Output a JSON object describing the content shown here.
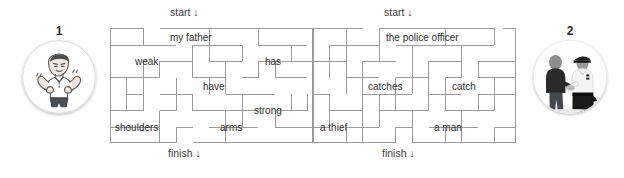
{
  "page": {
    "background_color": "#ffffff",
    "wall_color": "#9a9a9a",
    "text_color": "#2f2f2f"
  },
  "exercises": [
    {
      "number": "1",
      "avatar_icon": "strong-man-flexing-illustration",
      "avatar_alt": "cartoon man flexing biceps",
      "start_label": "start ↓",
      "finish_label": "finish ↓",
      "words": [
        {
          "text": "my father",
          "x": 63,
          "y": 10
        },
        {
          "text": "weak",
          "x": 26,
          "y": 33
        },
        {
          "text": "have",
          "x": 94,
          "y": 57
        },
        {
          "text": "has",
          "x": 156,
          "y": 33
        },
        {
          "text": "strong",
          "x": 146,
          "y": 80
        },
        {
          "text": "shoulders",
          "x": 6,
          "y": 101
        },
        {
          "text": "arms",
          "x": 112,
          "y": 101
        }
      ]
    },
    {
      "number": "2",
      "avatar_icon": "police-officer-photo",
      "avatar_alt": "police officer with a man photograph",
      "start_label": "start ↓",
      "finish_label": "finish ↓",
      "words": [
        {
          "text": "the police officer",
          "x": 74,
          "y": 10
        },
        {
          "text": "catches",
          "x": 56,
          "y": 57
        },
        {
          "text": "catch",
          "x": 140,
          "y": 57
        },
        {
          "text": "a thief",
          "x": 8,
          "y": 101
        },
        {
          "text": "a man",
          "x": 122,
          "y": 101
        }
      ]
    }
  ],
  "maze_geometry": {
    "cell": 16.5,
    "cols": 12,
    "rows": 7,
    "left_maze": {
      "x": 110,
      "y": 28,
      "width": 203,
      "height": 115,
      "start_label_x": 63,
      "finish_label_x": 63,
      "walls_h": [
        [
          0,
          0,
          2
        ],
        [
          3,
          0,
          9
        ],
        [
          0,
          1,
          2
        ],
        [
          2,
          1,
          2
        ],
        [
          5,
          1,
          3
        ],
        [
          9,
          1,
          3
        ],
        [
          3,
          2,
          2
        ],
        [
          6,
          2,
          2
        ],
        [
          9,
          2,
          3
        ],
        [
          0,
          3,
          2
        ],
        [
          2,
          3,
          1
        ],
        [
          5,
          3,
          2
        ],
        [
          8,
          3,
          1
        ],
        [
          10,
          3,
          2
        ],
        [
          1,
          4,
          1
        ],
        [
          3,
          4,
          2
        ],
        [
          7,
          4,
          3
        ],
        [
          0,
          5,
          2
        ],
        [
          3,
          5,
          1
        ],
        [
          5,
          5,
          4
        ],
        [
          10,
          5,
          2
        ],
        [
          0,
          6,
          3
        ],
        [
          4,
          6,
          1
        ],
        [
          6,
          6,
          3
        ],
        [
          10,
          6,
          2
        ],
        [
          0,
          7,
          4
        ],
        [
          5,
          7,
          4
        ],
        [
          10,
          7,
          2
        ]
      ],
      "walls_v": [
        [
          0,
          0,
          7
        ],
        [
          2,
          0,
          1
        ],
        [
          6,
          0,
          2
        ],
        [
          9,
          0,
          1
        ],
        [
          12,
          0,
          7
        ],
        [
          2,
          1,
          3
        ],
        [
          5,
          1,
          2
        ],
        [
          8,
          1,
          1
        ],
        [
          11,
          1,
          2
        ],
        [
          3,
          2,
          1
        ],
        [
          7,
          2,
          2
        ],
        [
          10,
          2,
          1
        ],
        [
          1,
          3,
          2
        ],
        [
          4,
          3,
          2
        ],
        [
          6,
          3,
          1
        ],
        [
          9,
          3,
          2
        ],
        [
          2,
          4,
          2
        ],
        [
          7,
          4,
          2
        ],
        [
          11,
          4,
          1
        ],
        [
          3,
          5,
          2
        ],
        [
          5,
          5,
          1
        ],
        [
          8,
          5,
          2
        ],
        [
          10,
          5,
          1
        ],
        [
          2,
          6,
          1
        ],
        [
          4,
          6,
          1
        ],
        [
          6,
          6,
          1
        ],
        [
          9,
          6,
          1
        ]
      ]
    },
    "right_maze": {
      "x": 313,
      "y": 28,
      "width": 203,
      "height": 115,
      "start_label_x": 74,
      "finish_label_x": 74,
      "walls_h": [
        [
          0,
          0,
          3
        ],
        [
          4,
          0,
          6
        ],
        [
          11,
          0,
          1
        ],
        [
          1,
          1,
          3
        ],
        [
          5,
          1,
          4
        ],
        [
          9,
          1,
          2
        ],
        [
          0,
          2,
          2
        ],
        [
          3,
          2,
          2
        ],
        [
          7,
          2,
          2
        ],
        [
          10,
          2,
          2
        ],
        [
          2,
          3,
          2
        ],
        [
          5,
          3,
          2
        ],
        [
          8,
          3,
          1
        ],
        [
          10,
          3,
          2
        ],
        [
          0,
          4,
          1
        ],
        [
          3,
          4,
          3
        ],
        [
          7,
          4,
          2
        ],
        [
          10,
          4,
          2
        ],
        [
          1,
          5,
          2
        ],
        [
          4,
          5,
          3
        ],
        [
          8,
          5,
          3
        ],
        [
          0,
          6,
          1
        ],
        [
          2,
          6,
          2
        ],
        [
          5,
          6,
          1
        ],
        [
          7,
          6,
          3
        ],
        [
          11,
          6,
          1
        ],
        [
          0,
          7,
          5
        ],
        [
          6,
          7,
          6
        ]
      ],
      "walls_v": [
        [
          0,
          0,
          7
        ],
        [
          2,
          0,
          3
        ],
        [
          4,
          0,
          2
        ],
        [
          8,
          0,
          1
        ],
        [
          11,
          0,
          1
        ],
        [
          12,
          0,
          7
        ],
        [
          1,
          1,
          2
        ],
        [
          6,
          1,
          3
        ],
        [
          9,
          1,
          2
        ],
        [
          3,
          2,
          3
        ],
        [
          7,
          2,
          2
        ],
        [
          10,
          2,
          1
        ],
        [
          2,
          3,
          1
        ],
        [
          5,
          3,
          2
        ],
        [
          8,
          3,
          2
        ],
        [
          11,
          3,
          2
        ],
        [
          1,
          4,
          2
        ],
        [
          4,
          4,
          2
        ],
        [
          7,
          4,
          1
        ],
        [
          10,
          4,
          1
        ],
        [
          3,
          5,
          2
        ],
        [
          6,
          5,
          2
        ],
        [
          9,
          5,
          2
        ],
        [
          2,
          6,
          1
        ],
        [
          5,
          6,
          1
        ],
        [
          8,
          6,
          1
        ],
        [
          11,
          6,
          1
        ]
      ]
    }
  }
}
